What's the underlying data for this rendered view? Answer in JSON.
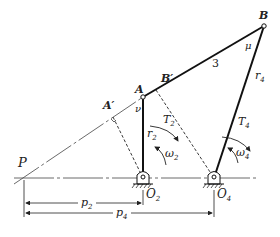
{
  "diagram": {
    "type": "four-bar linkage",
    "points": {
      "P": {
        "label": "P",
        "x": 22,
        "y": 178
      },
      "A": {
        "label": "A",
        "x": 143,
        "y": 97
      },
      "B": {
        "label": "B",
        "x": 264,
        "y": 26
      },
      "A_prime": {
        "label": "A′",
        "x": 113,
        "y": 117
      },
      "B_prime": {
        "label": "B′",
        "x": 156,
        "y": 90
      },
      "O2": {
        "label": "O",
        "sub": "2",
        "x": 143,
        "y": 178
      },
      "O4": {
        "label": "O",
        "sub": "4",
        "x": 214,
        "y": 178
      }
    },
    "links": {
      "coupler_label": "3",
      "r2": {
        "label": "r",
        "sub": "2"
      },
      "r4": {
        "label": "r",
        "sub": "4"
      }
    },
    "angles": {
      "nu": "ν",
      "mu": "μ"
    },
    "torques": {
      "T2": {
        "label": "T",
        "sub": "2"
      },
      "T4": {
        "label": "T",
        "sub": "4"
      }
    },
    "velocities": {
      "w2": {
        "label": "ω",
        "sub": "2"
      },
      "w4": {
        "label": "ω",
        "sub": "4"
      }
    },
    "dimensions": {
      "p2": {
        "label": "p",
        "sub": "2"
      },
      "p4": {
        "label": "p",
        "sub": "4"
      }
    },
    "colors": {
      "line": "#222222",
      "background": "#ffffff"
    }
  }
}
